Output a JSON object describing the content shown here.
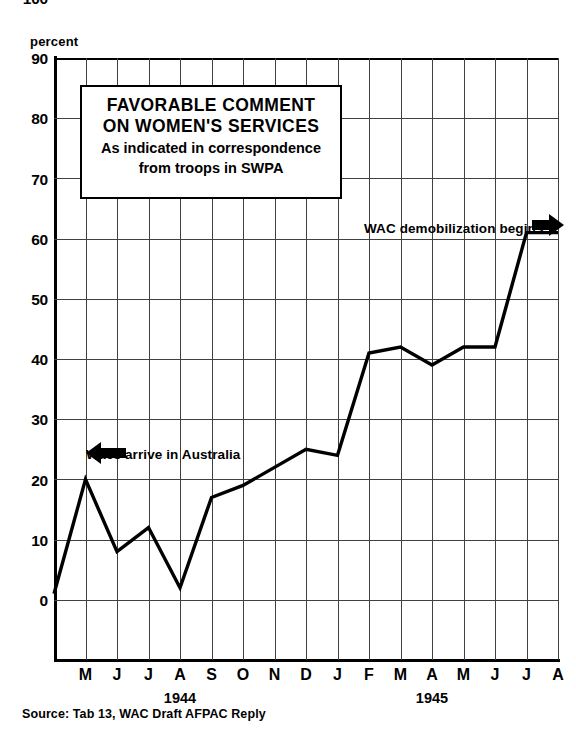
{
  "chart_data": {
    "type": "line",
    "title": "FAVORABLE COMMENT ON WOMEN'S SERVICES",
    "title_line1": "FAVORABLE COMMENT",
    "title_line2": "ON WOMEN'S SERVICES",
    "subtitle_line1": "As indicated in correspondence",
    "subtitle_line2": "from troops in SWPA",
    "xlabel": "",
    "ylabel": "percent",
    "ylim": [
      0,
      100
    ],
    "ytick_step": 10,
    "yticks": [
      "0",
      "10",
      "20",
      "30",
      "40",
      "50",
      "60",
      "70",
      "80",
      "90",
      "100"
    ],
    "grid": true,
    "legend": "none",
    "line_color": "#000000",
    "categories": [
      "",
      "M",
      "J",
      "J",
      "A",
      "S",
      "O",
      "N",
      "D",
      "J",
      "F",
      "M",
      "A",
      "M",
      "J",
      "J",
      "A"
    ],
    "values": [
      11,
      30,
      18,
      22,
      12,
      27,
      29,
      32,
      35,
      34,
      51,
      52,
      49,
      52,
      52,
      71,
      71
    ],
    "points": [
      {
        "x": "Apr 1944",
        "label": "",
        "value": 11
      },
      {
        "x": "M",
        "label": "M",
        "value": 30
      },
      {
        "x": "J",
        "label": "J",
        "value": 18
      },
      {
        "x": "J",
        "label": "J",
        "value": 22
      },
      {
        "x": "A",
        "label": "A",
        "value": 12
      },
      {
        "x": "S",
        "label": "S",
        "value": 27
      },
      {
        "x": "O",
        "label": "O",
        "value": 29
      },
      {
        "x": "N",
        "label": "N",
        "value": 32
      },
      {
        "x": "D",
        "label": "D",
        "value": 35
      },
      {
        "x": "J",
        "label": "J",
        "value": 34
      },
      {
        "x": "F",
        "label": "F",
        "value": 51
      },
      {
        "x": "M",
        "label": "M",
        "value": 52
      },
      {
        "x": "A",
        "label": "A",
        "value": 49
      },
      {
        "x": "M",
        "label": "M",
        "value": 52
      },
      {
        "x": "J",
        "label": "J",
        "value": 52
      },
      {
        "x": "J",
        "label": "J",
        "value": 71
      },
      {
        "x": "A",
        "label": "A",
        "value": 71
      }
    ],
    "year_labels": [
      {
        "text": "1944",
        "at_category_index": 4
      },
      {
        "text": "1945",
        "at_category_index": 12
      }
    ],
    "annotations": [
      {
        "text": "Wacs arrive in Australia",
        "arrow": "left-arrow",
        "at_value": 30
      },
      {
        "text": "WAC demobilization begins",
        "arrow": "right-arrow",
        "at_value": 71
      }
    ],
    "source": "Source: Tab 13, WAC Draft AFPAC Reply"
  }
}
